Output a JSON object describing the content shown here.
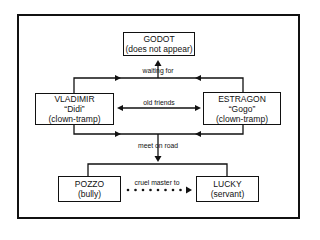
{
  "diagram": {
    "nodes": {
      "godot": {
        "name": "GODOT",
        "note": "(does not appear)"
      },
      "vladimir": {
        "name": "VLADIMIR",
        "nickname": "“Didi”",
        "role": "(clown-tramp)"
      },
      "estragon": {
        "name": "ESTRAGON",
        "nickname": "“Gogo”",
        "role": "(clown-tramp)"
      },
      "pozzo": {
        "name": "POZZO",
        "role": "(bully)"
      },
      "lucky": {
        "name": "LUCKY",
        "role": "(servant)"
      }
    },
    "edges": {
      "waiting_for": "waiting for",
      "old_friends": "old friends",
      "meet_on_road": "meet on road",
      "cruel_master_to": "cruel master to"
    },
    "relations": [
      {
        "from": "Vladimir & Estragon",
        "to": "Godot",
        "label": "waiting for",
        "style": "solid arrow"
      },
      {
        "from": "Vladimir",
        "to": "Estragon",
        "label": "old friends",
        "style": "double arrow"
      },
      {
        "from": "Vladimir & Estragon",
        "to": "Pozzo & Lucky",
        "label": "meet on road",
        "style": "solid arrow"
      },
      {
        "from": "Pozzo",
        "to": "Lucky",
        "label": "cruel master to",
        "style": "dotted arrow"
      }
    ],
    "colors": {
      "line": "#111111",
      "background": "#ffffff"
    }
  }
}
